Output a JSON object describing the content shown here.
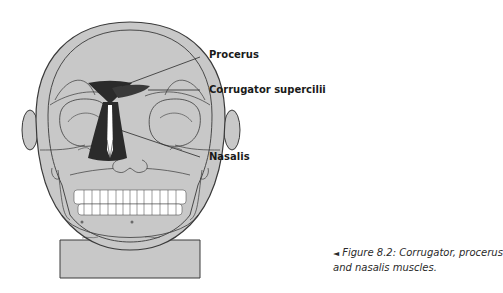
{
  "figure": {
    "labels": [
      {
        "id": "procerus",
        "text": "Procerus"
      },
      {
        "id": "corrugator",
        "text": "Corrugator supercilii"
      },
      {
        "id": "nasalis",
        "text": "Nasalis"
      }
    ],
    "caption": {
      "marker": "◄",
      "text": "Figure 8.2: Corrugator, procerus and nasalis muscles."
    },
    "colors": {
      "skin": "#c8c8c8",
      "outline": "#3a3a3a",
      "muscle": "#2b2b2b",
      "teeth": "#ffffff",
      "text": "#1a1a1a"
    }
  }
}
